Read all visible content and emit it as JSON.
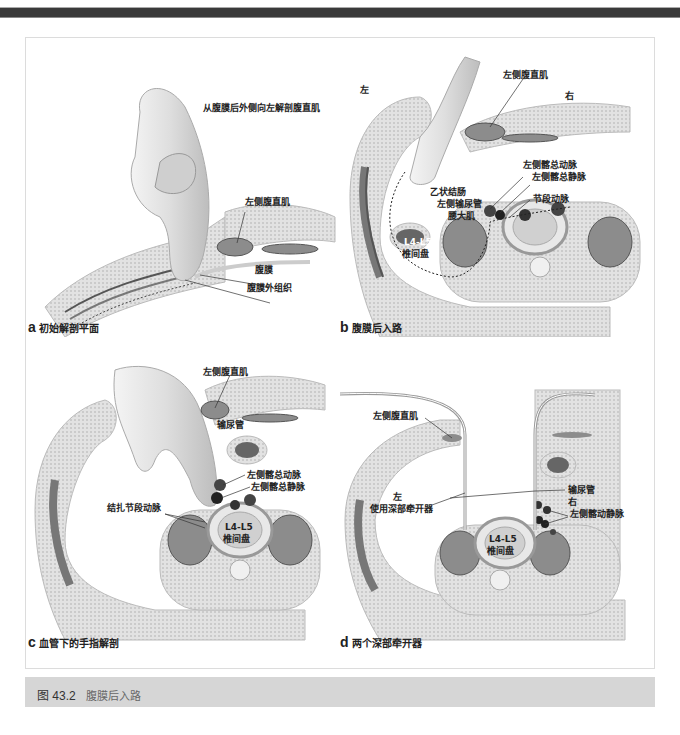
{
  "figure": {
    "number": "图 43.2",
    "title": "腹膜后入路"
  },
  "panels": {
    "a": {
      "letter": "a",
      "caption": "初始解剖平面",
      "labels": {
        "heading": "从腹膜后外侧向左解剖腹直肌",
        "rectus": "左侧腹直肌",
        "peritoneum": "腹膜",
        "extraperitoneal": "腹膜外组织"
      }
    },
    "b": {
      "letter": "b",
      "caption": "腹膜后入路",
      "labels": {
        "left": "左",
        "right": "右",
        "rectus": "左侧腹直肌",
        "iliac_artery": "左侧髂总动脉",
        "iliac_vein": "左侧髂总静脉",
        "sigmoid": "乙状结肠",
        "ureter": "左侧输尿管",
        "psoas": "腰大肌",
        "segmental_artery": "节段动脉",
        "disc_level": "L4-L5",
        "disc": "椎间盘"
      }
    },
    "c": {
      "letter": "c",
      "caption": "血管下的手指解剖",
      "labels": {
        "rectus": "左侧腹直肌",
        "ureter": "输尿管",
        "iliac_artery": "左侧髂总动脉",
        "iliac_vein": "左侧髂总静脉",
        "ligate_segmental": "结扎节段动脉",
        "disc_level": "L4-L5",
        "disc": "椎间盘"
      }
    },
    "d": {
      "letter": "d",
      "caption": "两个深部牵开器",
      "labels": {
        "rectus": "左侧腹直肌",
        "left": "左",
        "retractor": "使用深部牵开器",
        "ureter": "输尿管",
        "right": "右",
        "iliac_vessels": "左侧髂动静脉",
        "disc_level": "L4-L5",
        "disc": "椎间盘"
      }
    }
  },
  "colors": {
    "top_band": "#3a3a3a",
    "caption_bar": "#d6d6d6",
    "frame_border": "#dcdcdc",
    "tissue": "#d9d9d9",
    "muscle": "#8c8c8c",
    "vessel": "#333333"
  }
}
